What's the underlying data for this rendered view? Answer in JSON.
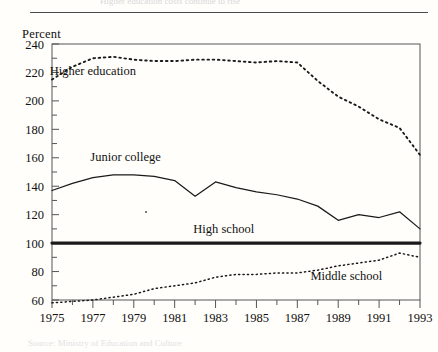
{
  "figure": {
    "cutoff_header_text": "Higher education costs continue to rise",
    "cutoff_footer_text": "Source: Ministry of Education and Culture",
    "y_axis_unit_label": "Percent"
  },
  "chart_data": {
    "type": "line",
    "title": "",
    "xlabel": "",
    "ylabel": "Percent",
    "xlim": [
      1975,
      1993
    ],
    "ylim": [
      60,
      240
    ],
    "ytick_step": 20,
    "yminor_step": 10,
    "xtick_step": 2,
    "grid": false,
    "legend": "inline-annotations",
    "ytick_labels": [
      "240",
      "220",
      "200",
      "180",
      "160",
      "140",
      "120",
      "100",
      "80",
      "60"
    ],
    "xtick_labels": [
      "1975",
      "1977",
      "1979",
      "1981",
      "1983",
      "1985",
      "1987",
      "1989",
      "1991",
      "1993"
    ],
    "x": [
      1975,
      1976,
      1977,
      1978,
      1979,
      1980,
      1981,
      1982,
      1983,
      1984,
      1985,
      1986,
      1987,
      1988,
      1989,
      1990,
      1991,
      1992,
      1993
    ],
    "series": [
      {
        "name": "Higher education",
        "style": "dashed",
        "label_x": 1977.0,
        "label_y": 218,
        "values": [
          215,
          224,
          230,
          231,
          229,
          228,
          228,
          229,
          229,
          228,
          227,
          228,
          227,
          214,
          203,
          196,
          187,
          181,
          162
        ]
      },
      {
        "name": "Junior college",
        "style": "solid",
        "label_x": 1978.6,
        "label_y": 158,
        "values": [
          137,
          142,
          146,
          148,
          148,
          147,
          144,
          133,
          143,
          139,
          136,
          134,
          131,
          126,
          116,
          120,
          118,
          122,
          110
        ]
      },
      {
        "name": "High school",
        "style": "thick",
        "label_x": 1983.4,
        "label_y": 107,
        "values": [
          100,
          100,
          100,
          100,
          100,
          100,
          100,
          100,
          100,
          100,
          100,
          100,
          100,
          100,
          100,
          100,
          100,
          100,
          100
        ]
      },
      {
        "name": "Middle school",
        "style": "dotted",
        "label_x": 1989.4,
        "label_y": 74,
        "values": [
          58,
          59,
          60,
          62,
          64,
          68,
          70,
          72,
          76,
          78,
          78,
          79,
          79,
          81,
          84,
          86,
          88,
          93,
          90
        ]
      }
    ]
  }
}
